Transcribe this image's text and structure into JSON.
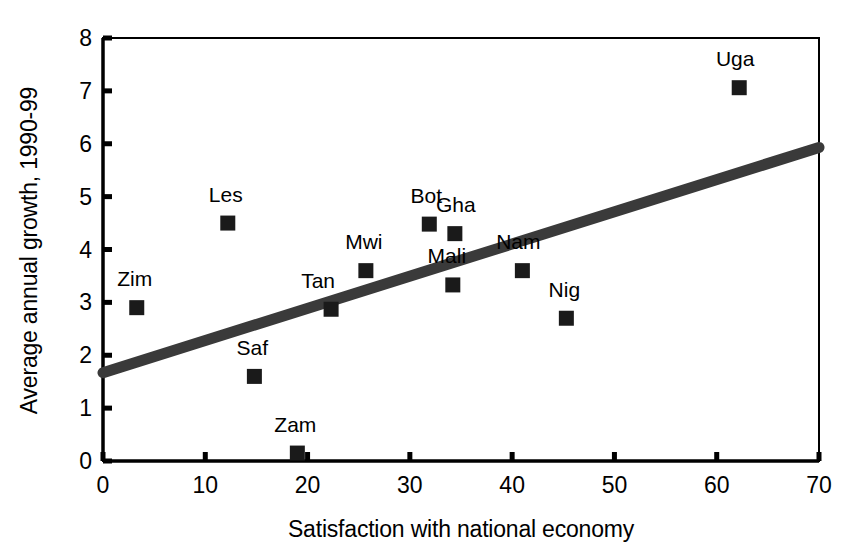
{
  "chart_data": {
    "type": "scatter",
    "title": "",
    "xlabel": "Satisfaction with national economy",
    "ylabel": "Average annual growth, 1990-99",
    "xlim": [
      0,
      70
    ],
    "ylim": [
      0,
      8
    ],
    "xticks": [
      "0",
      "10",
      "20",
      "30",
      "40",
      "50",
      "60",
      "70"
    ],
    "xtick_values": [
      0,
      10,
      20,
      30,
      40,
      50,
      60,
      70
    ],
    "yticks": [
      "0",
      "1",
      "2",
      "3",
      "4",
      "5",
      "6",
      "7",
      "8"
    ],
    "ytick_values": [
      0,
      1,
      2,
      3,
      4,
      5,
      6,
      7,
      8
    ],
    "grid": false,
    "legend": "none",
    "marker": "filled-square",
    "marker_color": "#1a1a1a",
    "axis_color": "#000000",
    "points": [
      {
        "label": "Zim",
        "x": 3.3,
        "y": 2.9,
        "label_dx": -2,
        "label_dy": -14
      },
      {
        "label": "Les",
        "x": 12.2,
        "y": 4.5,
        "label_dx": -2,
        "label_dy": -14
      },
      {
        "label": "Saf",
        "x": 14.8,
        "y": 1.6,
        "label_dx": -2,
        "label_dy": -14
      },
      {
        "label": "Zam",
        "x": 19.0,
        "y": 0.15,
        "label_dx": -2,
        "label_dy": -14
      },
      {
        "label": "Tan",
        "x": 22.3,
        "y": 2.87,
        "label_dx": -13,
        "label_dy": -14
      },
      {
        "label": "Mwi",
        "x": 25.7,
        "y": 3.6,
        "label_dx": -2,
        "label_dy": -14
      },
      {
        "label": "Bot",
        "x": 31.9,
        "y": 4.48,
        "label_dx": -3,
        "label_dy": -14
      },
      {
        "label": "Gha",
        "x": 34.4,
        "y": 4.3,
        "label_dx": 1,
        "label_dy": -14
      },
      {
        "label": "Mali",
        "x": 34.2,
        "y": 3.33,
        "label_dx": -6,
        "label_dy": -14
      },
      {
        "label": "Nam",
        "x": 41.0,
        "y": 3.6,
        "label_dx": -4,
        "label_dy": -14
      },
      {
        "label": "Nig",
        "x": 45.3,
        "y": 2.7,
        "label_dx": -2,
        "label_dy": -14
      },
      {
        "label": "Uga",
        "x": 62.2,
        "y": 7.06,
        "label_dx": -4,
        "label_dy": -14
      }
    ],
    "trendline": {
      "type": "line",
      "color": "#3a3a3a",
      "x0": 0,
      "y0": 1.67,
      "x1": 70,
      "y1": 5.93
    }
  }
}
